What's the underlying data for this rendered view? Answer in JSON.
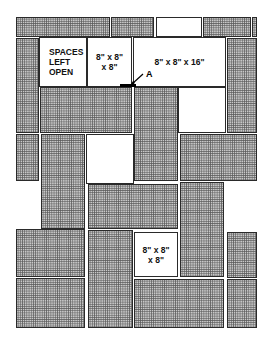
{
  "diagram": {
    "type": "block-wall-layout",
    "labels": {
      "spaces_left_open": "SPACES\nLEFT\nOPEN",
      "block_8x8x8_top": "8\" x 8\"\n x 8\"",
      "block_8x8x16": "8\" x 8\" x 16\"",
      "block_8x8x8_bottom": "8\" x 8\"\nx 8\"",
      "point_a": "A"
    },
    "colors": {
      "shaded_fill": "#c9c9c9",
      "outline": "#2a2a2a",
      "open_fill": "#ffffff"
    },
    "blocks": [
      {
        "id": "r1-a",
        "x": 16,
        "y": 17,
        "w": 94,
        "h": 20,
        "style": "shaded"
      },
      {
        "id": "r1-b",
        "x": 111,
        "y": 17,
        "w": 43,
        "h": 20,
        "style": "shaded"
      },
      {
        "id": "r1-c",
        "x": 156,
        "y": 17,
        "w": 46,
        "h": 20,
        "style": "open"
      },
      {
        "id": "r1-d",
        "x": 203,
        "y": 17,
        "w": 48,
        "h": 20,
        "style": "shaded"
      },
      {
        "id": "r1-e",
        "x": 252,
        "y": 17,
        "w": 5,
        "h": 20,
        "style": "shaded"
      },
      {
        "id": "left-1",
        "x": 16,
        "y": 38,
        "w": 23,
        "h": 95,
        "style": "shaded"
      },
      {
        "id": "open-space",
        "x": 39,
        "y": 37,
        "w": 48,
        "h": 50,
        "style": "open"
      },
      {
        "id": "cube-top",
        "x": 87,
        "y": 37,
        "w": 45,
        "h": 50,
        "style": "open"
      },
      {
        "id": "long-top",
        "x": 133,
        "y": 37,
        "w": 93,
        "h": 50,
        "style": "open"
      },
      {
        "id": "right-1",
        "x": 227,
        "y": 38,
        "w": 30,
        "h": 95,
        "style": "shaded"
      },
      {
        "id": "mid-h1",
        "x": 40,
        "y": 87,
        "w": 92,
        "h": 46,
        "style": "shaded"
      },
      {
        "id": "mid-v1",
        "x": 134,
        "y": 87,
        "w": 44,
        "h": 94,
        "style": "shaded"
      },
      {
        "id": "open-2",
        "x": 178,
        "y": 87,
        "w": 48,
        "h": 46,
        "style": "open"
      },
      {
        "id": "left-2",
        "x": 16,
        "y": 134,
        "w": 23,
        "h": 47,
        "style": "shaded"
      },
      {
        "id": "mid-v2",
        "x": 41,
        "y": 134,
        "w": 44,
        "h": 95,
        "style": "shaded"
      },
      {
        "id": "open-3",
        "x": 86,
        "y": 134,
        "w": 48,
        "h": 50,
        "style": "open"
      },
      {
        "id": "right-h1",
        "x": 180,
        "y": 134,
        "w": 77,
        "h": 47,
        "style": "shaded"
      },
      {
        "id": "mid-h2",
        "x": 88,
        "y": 184,
        "w": 90,
        "h": 45,
        "style": "shaded"
      },
      {
        "id": "right-v1",
        "x": 180,
        "y": 182,
        "w": 44,
        "h": 95,
        "style": "shaded"
      },
      {
        "id": "left-h1",
        "x": 16,
        "y": 229,
        "w": 69,
        "h": 48,
        "style": "shaded"
      },
      {
        "id": "mid-v3",
        "x": 88,
        "y": 230,
        "w": 45,
        "h": 98,
        "style": "shaded"
      },
      {
        "id": "cube-bottom",
        "x": 134,
        "y": 232,
        "w": 44,
        "h": 45,
        "style": "open"
      },
      {
        "id": "right-2",
        "x": 227,
        "y": 232,
        "w": 30,
        "h": 46,
        "style": "shaded"
      },
      {
        "id": "left-h2",
        "x": 16,
        "y": 278,
        "w": 69,
        "h": 50,
        "style": "shaded"
      },
      {
        "id": "bottom-h",
        "x": 134,
        "y": 279,
        "w": 90,
        "h": 49,
        "style": "shaded"
      },
      {
        "id": "right-3",
        "x": 227,
        "y": 279,
        "w": 30,
        "h": 49,
        "style": "shaded"
      }
    ],
    "marker": {
      "bar_x": 120,
      "bar_y": 84,
      "bar_w": 16,
      "bar_h": 3,
      "label_x": 144,
      "label_y": 70
    }
  }
}
